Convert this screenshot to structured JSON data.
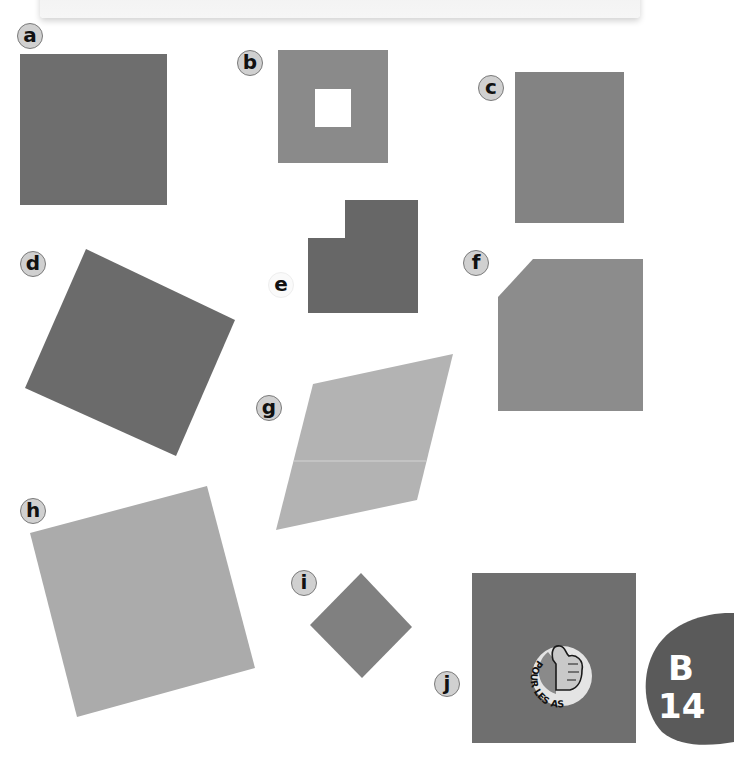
{
  "header": {
    "instruction_text": "Tu as fait les bons choix."
  },
  "figures": [
    {
      "label": "a",
      "shape": "square",
      "color": "#6e6e6e"
    },
    {
      "label": "b",
      "shape": "square-with-square-hole",
      "color": "#8a8a8a"
    },
    {
      "label": "c",
      "shape": "rectangle",
      "color": "#838383"
    },
    {
      "label": "d",
      "shape": "tilted-square",
      "color": "#6b6b6b"
    },
    {
      "label": "e",
      "shape": "l-shape",
      "color": "#676767"
    },
    {
      "label": "f",
      "shape": "pentagon-cut-corner",
      "color": "#8c8c8c"
    },
    {
      "label": "g",
      "shape": "parallelogram",
      "color": "#b3b3b3"
    },
    {
      "label": "h",
      "shape": "tilted-square",
      "color": "#ababab"
    },
    {
      "label": "i",
      "shape": "diamond",
      "color": "#808080"
    },
    {
      "label": "j",
      "shape": "square-with-badge",
      "color": "#6f6f6f"
    }
  ],
  "badge": {
    "text": "POUR LES AS",
    "icon": "thumbs-up-icon"
  },
  "page_tab": {
    "section": "B",
    "page_number": "14",
    "color": "#5a5a5a"
  }
}
